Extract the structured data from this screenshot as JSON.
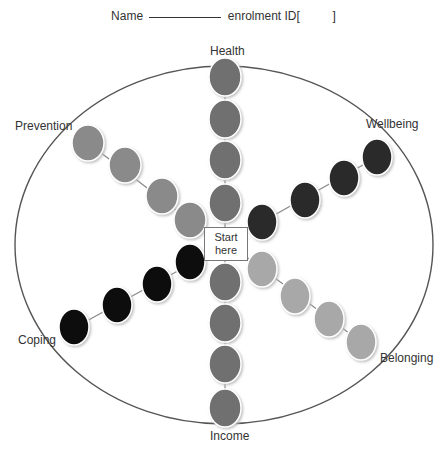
{
  "header": {
    "name_label": "Name",
    "enrolment_label": "enrolment ID[",
    "enrolment_close": "]"
  },
  "center": {
    "label_line1": "Start",
    "label_line2": "here"
  },
  "spokes": [
    {
      "label": "Health",
      "color": "#6f6f6f"
    },
    {
      "label": "Wellbeing",
      "color": "#2b2b2b"
    },
    {
      "label": "Belonging",
      "color": "#a8a8a8"
    },
    {
      "label": "Income",
      "color": "#6f6f6f"
    },
    {
      "label": "Coping",
      "color": "#111111"
    },
    {
      "label": "Prevention",
      "color": "#8a8a8a"
    }
  ],
  "steps_per_spoke": 4
}
